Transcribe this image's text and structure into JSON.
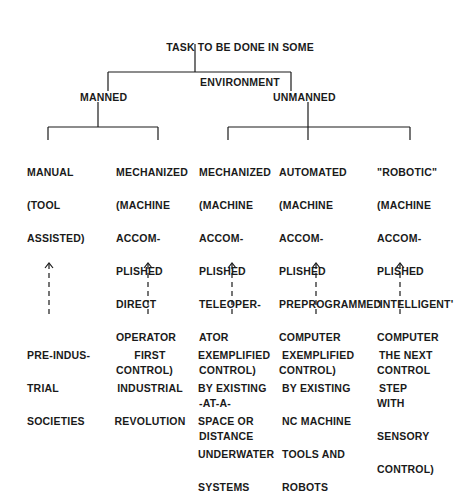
{
  "root": {
    "label_lines": [
      "TASK TO BE DONE IN SOME",
      "ENVIRONMENT"
    ]
  },
  "branches": [
    {
      "label": "MANNED",
      "children": [
        {
          "label_lines": [
            "MANUAL",
            "(TOOL",
            "ASSISTED)"
          ],
          "example_lines": [
            "PRE-INDUS-",
            "TRIAL",
            "SOCIETIES"
          ]
        },
        {
          "label_lines": [
            "MECHANIZED",
            "(MACHINE",
            "ACCOM-",
            "PLISHED",
            "DIRECT",
            "OPERATOR",
            "CONTROL)"
          ],
          "example_lines": [
            "FIRST",
            "INDUSTRIAL",
            "REVOLUTION"
          ]
        }
      ]
    },
    {
      "label": "UNMANNED",
      "children": [
        {
          "label_lines": [
            "MECHANIZED",
            "(MACHINE",
            "ACCOM-",
            "PLISHED",
            "TELEOPER-",
            "ATOR",
            "CONTROL)",
            "-AT-A-",
            "DISTANCE"
          ],
          "example_lines": [
            "EXEMPLIFIED",
            "BY EXISTING",
            "SPACE OR",
            "UNDERWATER",
            "SYSTEMS"
          ]
        },
        {
          "label_lines": [
            "AUTOMATED",
            "(MACHINE",
            "ACCOM-",
            "PLISHED",
            "PREPROGRAMMED",
            "COMPUTER",
            "CONTROL)"
          ],
          "example_lines": [
            "EXEMPLIFIED",
            "BY EXISTING",
            "NC MACHINE",
            "TOOLS AND",
            "ROBOTS"
          ]
        },
        {
          "label_lines": [
            "\"ROBOTIC\"",
            "(MACHINE",
            "ACCOM-",
            "PLISHED",
            "'INTELLIGENT'",
            "COMPUTER",
            "CONTROL",
            "WITH",
            "SENSORY",
            "CONTROL)"
          ],
          "example_lines": [
            "THE NEXT",
            "STEP"
          ]
        }
      ]
    }
  ],
  "connector_style": {
    "tree_edges": "solid",
    "example_arrows": "dashed-up-arrow"
  },
  "colors": {
    "ink": "#1a1a1a",
    "background": "#ffffff"
  }
}
